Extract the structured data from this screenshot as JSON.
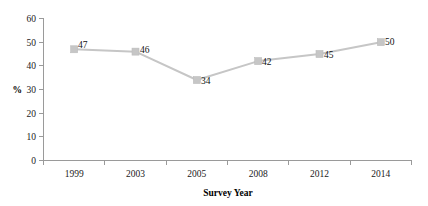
{
  "chart_data": {
    "type": "line",
    "title": "",
    "subtitle": "",
    "xlabel": "Survey Year",
    "ylabel": "%",
    "categories": [
      "1999",
      "2003",
      "2005",
      "2008",
      "2012",
      "2014"
    ],
    "values": [
      47,
      46,
      34,
      42,
      45,
      50
    ],
    "data_labels": [
      "47",
      "46",
      "34",
      "42",
      "45",
      "50"
    ],
    "ylim": [
      0,
      60
    ],
    "y_ticks": [
      "0",
      "10",
      "20",
      "30",
      "40",
      "50",
      "60"
    ],
    "y_tick_values": [
      0,
      10,
      20,
      30,
      40,
      50,
      60
    ],
    "grid": false,
    "legend": false,
    "legend_position": "none",
    "series": [
      {
        "name": "",
        "values": [
          47,
          46,
          34,
          42,
          45,
          50
        ],
        "line_color": "#c6c6c6",
        "marker_color": "#c6c6c6",
        "marker": "square"
      }
    ]
  },
  "axes": {
    "y": {
      "title": "%",
      "ticks": [
        {
          "label": "60",
          "value": 60
        },
        {
          "label": "50",
          "value": 50
        },
        {
          "label": "40",
          "value": 40
        },
        {
          "label": "30",
          "value": 30
        },
        {
          "label": "20",
          "value": 20
        },
        {
          "label": "10",
          "value": 10
        },
        {
          "label": "0",
          "value": 0
        }
      ]
    },
    "x": {
      "title": "Survey Year",
      "ticks": [
        {
          "label": "1999"
        },
        {
          "label": "2003"
        },
        {
          "label": "2005"
        },
        {
          "label": "2008"
        },
        {
          "label": "2012"
        },
        {
          "label": "2014"
        }
      ]
    }
  },
  "points": [
    {
      "category": "1999",
      "value": 47,
      "label": "47"
    },
    {
      "category": "2003",
      "value": 46,
      "label": "46"
    },
    {
      "category": "2005",
      "value": 34,
      "label": "34"
    },
    {
      "category": "2008",
      "value": 42,
      "label": "42"
    },
    {
      "category": "2012",
      "value": 45,
      "label": "45"
    },
    {
      "category": "2014",
      "value": 50,
      "label": "50"
    }
  ],
  "colors": {
    "series": "#c6c6c6",
    "axis": "#9a9a9a",
    "text": "#111111",
    "background": "#ffffff"
  }
}
